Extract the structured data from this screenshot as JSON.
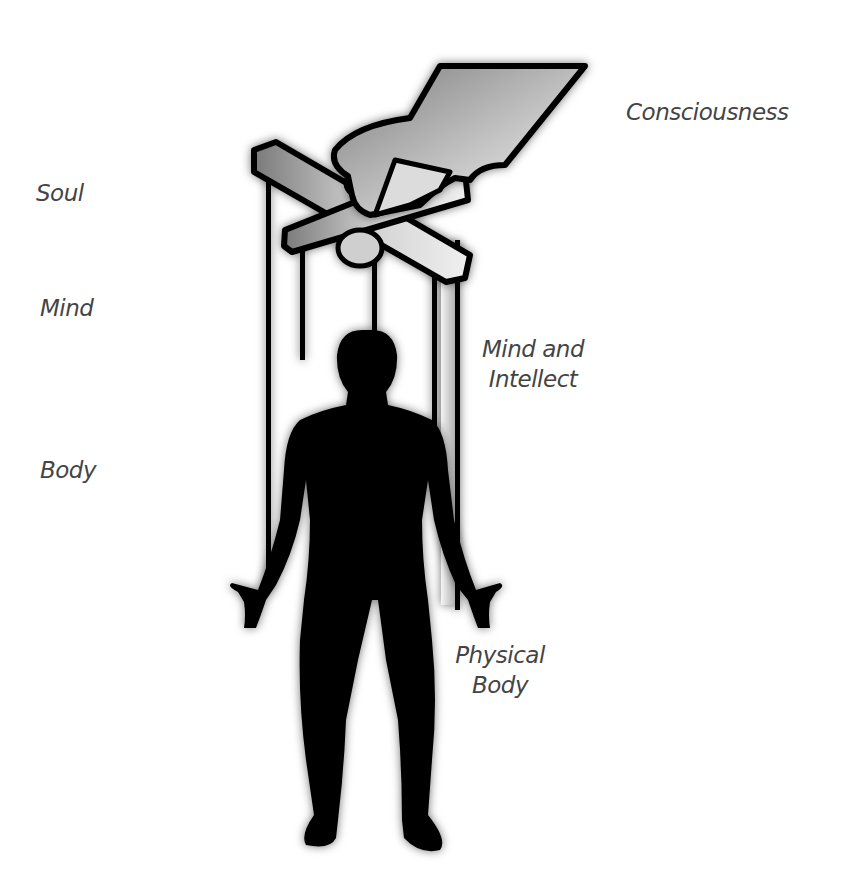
{
  "labels": {
    "consciousness": "Consciousness",
    "soul": "Soul",
    "mind": "Mind",
    "body": "Body",
    "mind_and_intellect_line1": "Mind and",
    "mind_and_intellect_line2": "Intellect",
    "physical_body_line1": "Physical",
    "physical_body_line2": "Body"
  },
  "illustration": {
    "elements": [
      "hand-icon",
      "marionette-control-bar-icon",
      "puppet-strings",
      "human-silhouette-icon"
    ],
    "colors": {
      "silhouette": "#000000",
      "bar_fill_light": "#e8e8e8",
      "bar_fill_dark": "#8a8a8a",
      "text": "#444444",
      "background": "#ffffff"
    }
  }
}
